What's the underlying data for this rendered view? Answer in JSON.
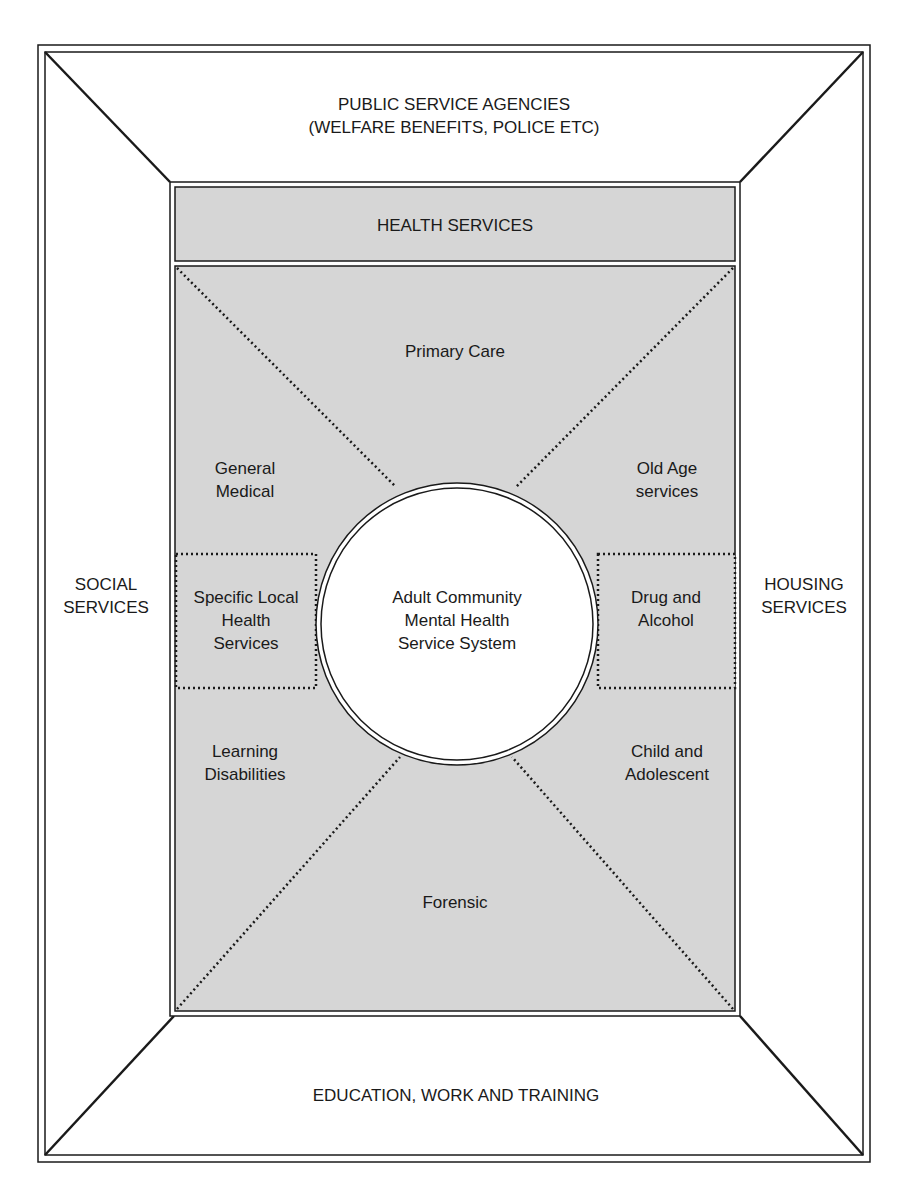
{
  "diagram": {
    "colors": {
      "background": "#ffffff",
      "shade": "#d6d6d6",
      "line": "#1a1a1a",
      "circle_fill": "#ffffff"
    },
    "outer_regions": {
      "top": "PUBLIC SERVICE AGENCIES\n(WELFARE BENEFITS, POLICE ETC)",
      "left": "SOCIAL\nSERVICES",
      "right": "HOUSING\nSERVICES",
      "bottom": "EDUCATION, WORK AND TRAINING"
    },
    "health_band": {
      "label": "HEALTH SERVICES"
    },
    "inner_regions": {
      "top": "Primary Care",
      "upper_left": "General\nMedical",
      "upper_right": "Old Age\nservices",
      "left_box": "Specific Local\nHealth\nServices",
      "right_box": "Drug and\nAlcohol",
      "lower_left": "Learning\nDisabilities",
      "lower_right": "Child and\nAdolescent",
      "bottom": "Forensic"
    },
    "center": {
      "label": "Adult Community\nMental Health\nService System"
    }
  }
}
